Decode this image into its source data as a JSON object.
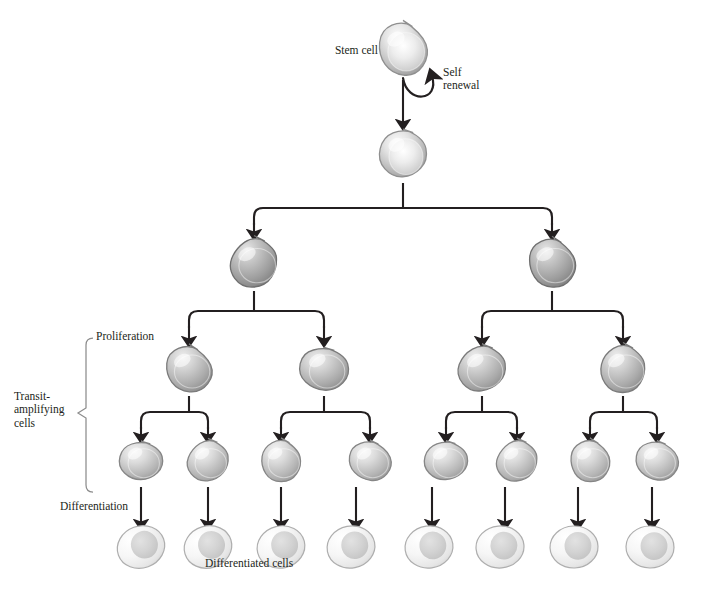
{
  "diagram": {
    "background_color": "#ffffff",
    "ink_color": "#231f20",
    "labels": {
      "stem_cell": "Stem cell",
      "self_renewal": "Self\nrenewal",
      "proliferation": "Proliferation",
      "transit_amplifying": "Transit-\namplifying\ncells",
      "differentiation": "Differentiation",
      "differentiated_cells": "Differentiated cells"
    },
    "label_positions": [
      {
        "key": "stem_cell",
        "name": "label-stem-cell",
        "x": 312,
        "y": 44,
        "size": 11.5,
        "align": "right",
        "w": 66
      },
      {
        "key": "self_renewal",
        "name": "label-self-renewal",
        "x": 443,
        "y": 66,
        "size": 11.5,
        "align": "left",
        "w": 70
      },
      {
        "key": "proliferation",
        "name": "label-proliferation",
        "x": 96,
        "y": 330,
        "size": 11.5,
        "align": "left",
        "w": 90
      },
      {
        "key": "transit_amplifying",
        "name": "label-transit-amplifying",
        "x": 14,
        "y": 390,
        "size": 11.5,
        "align": "left",
        "w": 72
      },
      {
        "key": "differentiation",
        "name": "label-differentiation",
        "x": 60,
        "y": 500,
        "size": 11.5,
        "align": "left",
        "w": 100
      },
      {
        "key": "differentiated_cells",
        "name": "label-differentiated-cells",
        "x": 205,
        "y": 557,
        "size": 11.5,
        "align": "left",
        "w": 140
      }
    ],
    "rows": [
      {
        "id": "row-stem",
        "name": "stem-cell-row",
        "cell_type": "stem",
        "shape": "blob",
        "fill": "#b9b9b9",
        "count": 1,
        "cy": 49,
        "rx": 27,
        "ry": 29,
        "centers": [
          403
        ]
      },
      {
        "id": "row-stem-daughter",
        "name": "stem-daughter-row",
        "cell_type": "stem",
        "shape": "blob",
        "fill": "#b9b9b9",
        "count": 1,
        "cy": 154,
        "rx": 25,
        "ry": 27,
        "centers": [
          403
        ]
      },
      {
        "id": "row-ta-1",
        "name": "transit-amplifying-row-1",
        "cell_type": "transit-amplifying",
        "shape": "round-blob",
        "fill": "#9a9a9a",
        "count": 2,
        "cy": 263,
        "rx": 27,
        "ry": 26,
        "centers": [
          254,
          552
        ]
      },
      {
        "id": "row-ta-2",
        "name": "transit-amplifying-row-2",
        "cell_type": "transit-amplifying",
        "shape": "round-blob",
        "fill": "#a8a8a8",
        "count": 4,
        "cy": 369,
        "rx": 26,
        "ry": 25,
        "centers": [
          189,
          324,
          482,
          623
        ]
      },
      {
        "id": "row-ta-3",
        "name": "transit-amplifying-row-3",
        "cell_type": "transit-amplifying",
        "shape": "round-blob",
        "fill": "#b4b4b4",
        "count": 8,
        "cy": 461,
        "rx": 23,
        "ry": 22,
        "centers": [
          141,
          208,
          281,
          370,
          446,
          517,
          590,
          657
        ]
      },
      {
        "id": "row-diff",
        "name": "differentiated-row",
        "cell_type": "differentiated",
        "shape": "oval",
        "fill": "#ededed",
        "count": 8,
        "cy": 547,
        "rx": 24,
        "ry": 21,
        "centers": [
          141,
          208,
          281,
          351,
          429,
          500,
          574,
          650
        ]
      }
    ],
    "connections": {
      "self_renewal_loop": {
        "name": "self-renewal-arrow",
        "from": [
          403,
          78
        ],
        "to": [
          428,
          72
        ],
        "description": "curved arrow from stem cell back onto itself"
      },
      "straight_arrows": [
        {
          "name": "arrow-stem-to-daughter",
          "x": 403,
          "y1": 80,
          "y2": 124
        }
      ],
      "splits": [
        {
          "name": "split-daughter-to-ta1",
          "parent_x": 403,
          "parent_y": 183,
          "bus_y": 208,
          "children": [
            254,
            552
          ],
          "child_y": 234
        },
        {
          "name": "split-ta1a-to-ta2",
          "parent_x": 254,
          "parent_y": 291,
          "bus_y": 311,
          "children": [
            189,
            324
          ],
          "child_y": 341
        },
        {
          "name": "split-ta1b-to-ta2",
          "parent_x": 552,
          "parent_y": 291,
          "bus_y": 311,
          "children": [
            482,
            623
          ],
          "child_y": 341
        },
        {
          "name": "split-ta2a-to-ta3",
          "parent_x": 189,
          "parent_y": 396,
          "bus_y": 412,
          "children": [
            141,
            208
          ],
          "child_y": 437
        },
        {
          "name": "split-ta2b-to-ta3",
          "parent_x": 324,
          "parent_y": 396,
          "bus_y": 412,
          "children": [
            281,
            370
          ],
          "child_y": 437
        },
        {
          "name": "split-ta2c-to-ta3",
          "parent_x": 482,
          "parent_y": 396,
          "bus_y": 412,
          "children": [
            446,
            517
          ],
          "child_y": 437
        },
        {
          "name": "split-ta2d-to-ta3",
          "parent_x": 623,
          "parent_y": 396,
          "bus_y": 412,
          "children": [
            590,
            657
          ],
          "child_y": 437
        }
      ],
      "differentiation_arrows": [
        {
          "name": "arrow-diff-1",
          "x": 141,
          "y1": 487,
          "y2": 524
        },
        {
          "name": "arrow-diff-2",
          "x": 208,
          "y1": 487,
          "y2": 524
        },
        {
          "name": "arrow-diff-3",
          "x": 281,
          "y1": 487,
          "y2": 524
        },
        {
          "name": "arrow-diff-4",
          "x": 356,
          "y1": 487,
          "y2": 524
        },
        {
          "name": "arrow-diff-5",
          "x": 432,
          "y1": 487,
          "y2": 524
        },
        {
          "name": "arrow-diff-6",
          "x": 505,
          "y1": 487,
          "y2": 524
        },
        {
          "name": "arrow-diff-7",
          "x": 578,
          "y1": 487,
          "y2": 524
        },
        {
          "name": "arrow-diff-8",
          "x": 652,
          "y1": 487,
          "y2": 524
        }
      ],
      "bracket": {
        "name": "transit-amplifying-bracket",
        "x": 86,
        "y_top": 338,
        "y_bottom": 492,
        "tip_x": 78,
        "tip_y": 413
      }
    }
  }
}
